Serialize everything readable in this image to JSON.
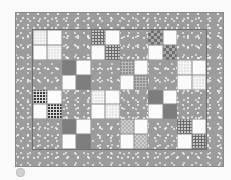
{
  "image": {
    "subject": "Four-patch quilt layout",
    "colors": {
      "background": "#fafafa",
      "border_fabric": "#9c9c9c",
      "white": "#fbfbfb",
      "dark_solid": "#7d7d7d"
    }
  },
  "quilt": {
    "columns": 6,
    "rows": 4,
    "blocks": [
      [
        "f-light",
        "gray",
        "f-plaid",
        "gray",
        "f-darkcheck",
        "gray"
      ],
      [
        "gray",
        "f-dark",
        "gray",
        "f-dotted",
        "gray",
        "f-light"
      ],
      [
        "f-blackplaid",
        "gray",
        "f-light",
        "gray",
        "f-dark",
        "gray"
      ],
      [
        "gray",
        "f-dark",
        "gray",
        "f-pinkcheck",
        "gray",
        "f-plaid"
      ]
    ]
  },
  "indicator": {
    "icon": "circle-dot-icon"
  }
}
